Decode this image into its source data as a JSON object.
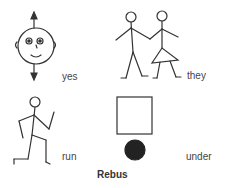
{
  "symbols": [
    {
      "label": "yes",
      "icon": "face-with-up-down-arrows-icon"
    },
    {
      "label": "they",
      "icon": "two-stick-figures-holding-hands-icon"
    },
    {
      "label": "run",
      "icon": "running-stick-figure-icon"
    },
    {
      "label": "under",
      "icon": "circle-under-square-icon"
    }
  ],
  "caption": "Rebus",
  "colors": {
    "stroke": "#333333",
    "fill": "#222222",
    "background": "#ffffff"
  }
}
